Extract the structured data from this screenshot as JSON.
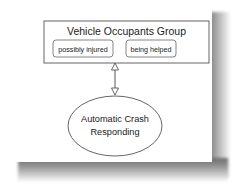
{
  "diagram": {
    "group": {
      "title": "Vehicle Occupants Group",
      "states": [
        {
          "label": "possibly injured"
        },
        {
          "label": "being helped"
        }
      ]
    },
    "connector": {
      "type": "bidirectional-arrow",
      "from": "Vehicle Occupants Group",
      "to": "Automatic Crash Responding"
    },
    "process": {
      "line1": "Automatic Crash",
      "line2": "Responding"
    }
  },
  "colors": {
    "stroke": "#444444",
    "text": "#1a1a1a",
    "background": "#ffffff"
  }
}
